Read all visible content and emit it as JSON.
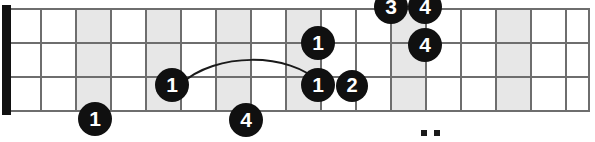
{
  "diagram": {
    "kind": "guitar-fretboard-scale-diagram",
    "orientation": "horizontal",
    "string_count": 3,
    "visible_string_lines": 4,
    "fret_count": 16,
    "nut_shown": true,
    "colors": {
      "background": "#ffffff",
      "grid_line": "#6e6e6e",
      "shaded_fret": "#e7e7e7",
      "nut": "#111111",
      "dot_fill": "#101010",
      "dot_text": "#ffffff",
      "slur": "#1a1a1a"
    },
    "geometry": {
      "board_left": 10,
      "board_right": 590,
      "board_top": 8,
      "board_bottom": 110,
      "string_y": [
        8,
        42,
        76,
        110
      ],
      "fret_x": [
        10,
        40,
        75,
        110,
        145,
        180,
        215,
        250,
        285,
        320,
        355,
        390,
        425,
        460,
        495,
        530,
        565,
        590
      ],
      "nut": {
        "x": 2,
        "y": 5,
        "width": 9,
        "height": 110
      }
    },
    "shaded_frets": [
      {
        "name": "shaded-fret-3",
        "x": 75,
        "width": 35
      },
      {
        "name": "shaded-fret-5",
        "x": 145,
        "width": 35
      },
      {
        "name": "shaded-fret-7",
        "x": 215,
        "width": 35
      },
      {
        "name": "shaded-fret-9",
        "x": 285,
        "width": 35
      },
      {
        "name": "shaded-fret-12",
        "x": 390,
        "width": 35
      },
      {
        "name": "shaded-fret-15",
        "x": 495,
        "width": 35
      }
    ],
    "inlay_markers": [
      {
        "name": "inlay-marker-left",
        "x": 424,
        "y": 132,
        "size": 6
      },
      {
        "name": "inlay-marker-right",
        "x": 437,
        "y": 132,
        "size": 6
      }
    ],
    "slur": {
      "name": "slur-arc",
      "path": "M 181 84 C 215 52, 290 52, 320 83",
      "stroke_width": 2
    },
    "notes": [
      {
        "name": "note-dot-1",
        "label": "1",
        "cx": 95,
        "cy": 119,
        "r": 17,
        "string_index": 3,
        "fret_position": "3"
      },
      {
        "name": "note-dot-2",
        "label": "1",
        "cx": 172,
        "cy": 85,
        "r": 17,
        "string_index": 2,
        "fret_position": "5"
      },
      {
        "name": "note-dot-3",
        "label": "4",
        "cx": 246,
        "cy": 120,
        "r": 17,
        "string_index": 3,
        "fret_position": "7"
      },
      {
        "name": "note-dot-4",
        "label": "1",
        "cx": 318,
        "cy": 43,
        "r": 17,
        "string_index": 1,
        "fret_position": "9"
      },
      {
        "name": "note-dot-5",
        "label": "1",
        "cx": 318,
        "cy": 85,
        "r": 17,
        "string_index": 2,
        "fret_position": "9"
      },
      {
        "name": "note-dot-6",
        "label": "2",
        "cx": 352,
        "cy": 86,
        "r": 16,
        "string_index": 2,
        "fret_position": "10"
      },
      {
        "name": "note-dot-7",
        "label": "3",
        "cx": 391,
        "cy": 7,
        "r": 17,
        "string_index": 0,
        "fret_position": "11"
      },
      {
        "name": "note-dot-8",
        "label": "4",
        "cx": 425,
        "cy": 7,
        "r": 17,
        "string_index": 0,
        "fret_position": "12"
      },
      {
        "name": "note-dot-9",
        "label": "4",
        "cx": 425,
        "cy": 45,
        "r": 17,
        "string_index": 1,
        "fret_position": "12"
      }
    ]
  }
}
